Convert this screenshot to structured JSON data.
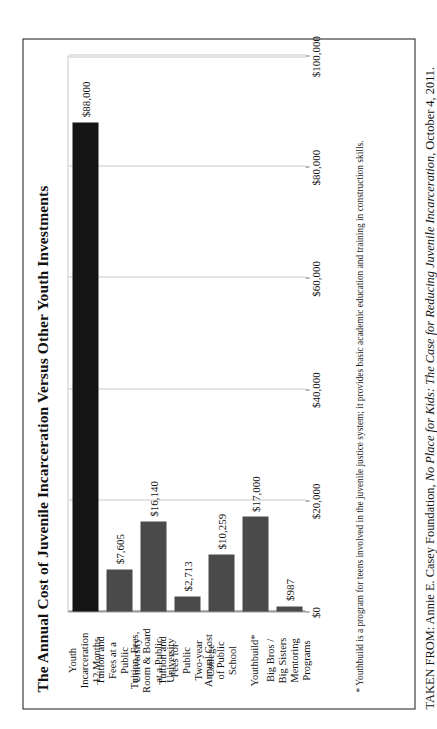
{
  "chart_data": {
    "type": "bar",
    "orientation": "vertical",
    "title": "The Annual Cost of Juvenile Incarceration Versus Other Youth Investments",
    "xlabel": "",
    "ylabel": "",
    "ylim": [
      0,
      100000
    ],
    "grid": true,
    "legend": "none",
    "categories": [
      "Youth Incarceration 12 Months",
      "Tuition and Fees at a Public University",
      "Tuition, Fees, Room & Board at a Public University",
      "Tuition and Fees for Public Two-year College",
      "Annual Cost of Public School",
      "Youthbuild*",
      "Big Bros / Big Sisters Mentoring Programs"
    ],
    "category_lines": [
      [
        "Youth",
        "Incarceration",
        "12 Months"
      ],
      [
        "Tuition and",
        "Fees at a",
        "Public",
        "University"
      ],
      [
        "Tuition, Fees,",
        "Room & Board",
        "at a Public",
        "University"
      ],
      [
        "Tuition and",
        "Fees for",
        "Public",
        "Two-year",
        "College"
      ],
      [
        "Annual Cost",
        "of Public",
        "School"
      ],
      [
        "Youthbuild*"
      ],
      [
        "Big Bros /",
        "Big Sisters",
        "Mentoring",
        "Programs"
      ]
    ],
    "values": [
      88000,
      7605,
      16140,
      2713,
      10259,
      17000,
      987
    ],
    "value_labels": [
      "$88,000",
      "$7,605",
      "$16,140",
      "$2,713",
      "$10,259",
      "$17,000",
      "$987"
    ],
    "tick_values": [
      0,
      20000,
      40000,
      60000,
      80000,
      100000
    ],
    "tick_labels": [
      "$0",
      "$20,000",
      "$40,000",
      "$60,000",
      "$80,000",
      "$100,000"
    ],
    "bar_colors": [
      "#151515",
      "#4a4a4a",
      "#4a4a4a",
      "#4a4a4a",
      "#4a4a4a",
      "#4a4a4a",
      "#4a4a4a"
    ]
  },
  "footnote": "* Youthbuild is a program for teens involved in the juvenile justice system; it provides basic academic education and training in construction skills.",
  "source": {
    "prefix": "TAKEN FROM: Annie E. Casey Foundation, ",
    "work_title": "No Place for Kids: The Case for Reducing Juvenile Incarceration",
    "suffix": ", October 4, 2011."
  },
  "colors": {
    "frame": "#1a1a1a",
    "gridline": "#c9c9c9",
    "axis": "#6d6d6d",
    "bar_default": "#4a4a4a",
    "bar_highlight": "#151515"
  }
}
